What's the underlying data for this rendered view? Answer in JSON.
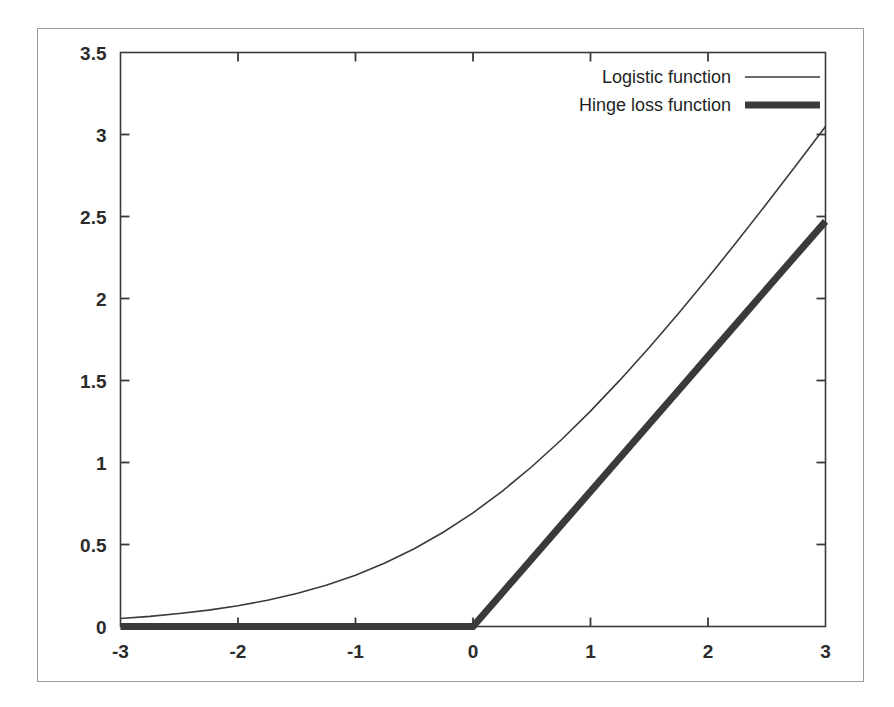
{
  "figure": {
    "background_color": "#ffffff",
    "frame_color": "#9a9a9a",
    "axis_color": "#3a3a3a"
  },
  "chart_data": {
    "type": "line",
    "title": "",
    "subtitle": "",
    "xlabel": "",
    "ylabel": "",
    "xlim": [
      -3,
      3
    ],
    "ylim": [
      0,
      3.5
    ],
    "grid": false,
    "legend_position": "top-right-inside",
    "x_ticks": [
      -3,
      -2,
      -1,
      0,
      1,
      2,
      3
    ],
    "x_tick_labels": [
      "-3",
      "-2",
      "-1",
      "0",
      "1",
      "2",
      "3"
    ],
    "y_ticks": [
      0,
      0.5,
      1,
      1.5,
      2,
      2.5,
      3,
      3.5
    ],
    "y_tick_labels": [
      "0",
      "0.5",
      "1",
      "1.5",
      "2",
      "2.5",
      "3",
      "3.5"
    ],
    "x": [
      -3,
      -2.75,
      -2.5,
      -2.25,
      -2,
      -1.75,
      -1.5,
      -1.25,
      -1,
      -0.75,
      -0.5,
      -0.25,
      0,
      0.25,
      0.5,
      0.75,
      1,
      1.25,
      1.5,
      1.75,
      2,
      2.25,
      2.5,
      2.75,
      3
    ],
    "series": [
      {
        "name": "Logistic function",
        "color": "#3a3a3a",
        "line_width": 1.6,
        "style": "thin-solid",
        "values": [
          0.049,
          0.062,
          0.079,
          0.1,
          0.127,
          0.16,
          0.201,
          0.252,
          0.313,
          0.387,
          0.474,
          0.576,
          0.693,
          0.826,
          0.974,
          1.137,
          1.313,
          1.502,
          1.701,
          1.91,
          2.127,
          2.35,
          2.579,
          2.812,
          3.049
        ]
      },
      {
        "name": "Hinge loss function",
        "color": "#3a3a3a",
        "line_width": 7,
        "style": "thick-solid",
        "values": [
          0,
          0,
          0,
          0,
          0,
          0,
          0,
          0,
          0,
          0,
          0,
          0,
          0,
          0.206,
          0.412,
          0.618,
          0.823,
          1.029,
          1.235,
          1.441,
          1.647,
          1.853,
          2.059,
          2.265,
          2.47
        ]
      }
    ],
    "annotations": []
  },
  "legend": {
    "entries": [
      {
        "label": "Logistic function",
        "sample": "thin-line-sample"
      },
      {
        "label": "Hinge loss function",
        "sample": "thick-line-sample"
      }
    ]
  }
}
